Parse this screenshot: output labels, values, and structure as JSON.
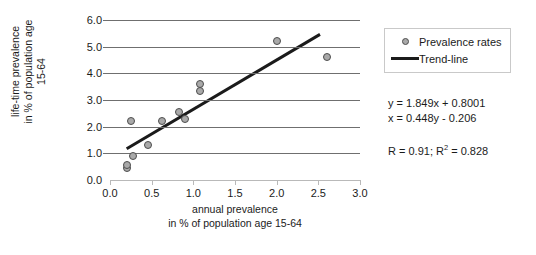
{
  "chart_data": {
    "type": "scatter",
    "title": "",
    "xlabel": "annual prevalence in % of population age 15-64",
    "ylabel": "life-time prevalence in % of population age 15-64",
    "xlim": [
      0.0,
      3.0
    ],
    "ylim": [
      0.0,
      6.0
    ],
    "grid": true,
    "legend_position": "right",
    "x_ticks": [
      "0.0",
      "0.5",
      "1.0",
      "1.5",
      "2.0",
      "2.5",
      "3.0"
    ],
    "x_tick_values": [
      0.0,
      0.5,
      1.0,
      1.5,
      2.0,
      2.5,
      3.0
    ],
    "y_ticks": [
      "0.0",
      "1.0",
      "2.0",
      "3.0",
      "4.0",
      "5.0",
      "6.0"
    ],
    "y_tick_values": [
      0.0,
      1.0,
      2.0,
      3.0,
      4.0,
      5.0,
      6.0
    ],
    "series": [
      {
        "name": "Prevalence rates",
        "type": "scatter",
        "marker": "circle",
        "points": [
          {
            "x": 0.2,
            "y": 0.45
          },
          {
            "x": 0.2,
            "y": 0.55
          },
          {
            "x": 0.27,
            "y": 0.9
          },
          {
            "x": 0.25,
            "y": 2.2
          },
          {
            "x": 0.45,
            "y": 1.3
          },
          {
            "x": 0.62,
            "y": 2.2
          },
          {
            "x": 0.83,
            "y": 2.55
          },
          {
            "x": 0.9,
            "y": 2.3
          },
          {
            "x": 1.08,
            "y": 3.6
          },
          {
            "x": 1.08,
            "y": 3.35
          },
          {
            "x": 2.0,
            "y": 5.2
          },
          {
            "x": 2.6,
            "y": 4.6
          }
        ]
      },
      {
        "name": "Trend-line",
        "type": "line",
        "equation": "y = 1.849x + 0.8001",
        "slope": 1.849,
        "intercept": 0.8001,
        "x_start": 0.2,
        "x_end": 2.52
      }
    ]
  },
  "legend": {
    "items": [
      {
        "label": "Prevalence rates",
        "marker": "circle-marker"
      },
      {
        "label": "Trend-line",
        "marker": "line-marker"
      }
    ]
  },
  "stats": {
    "equation_y": "y = 1.849x + 0.8001",
    "equation_x": "x = 0.448y - 0.206",
    "r_prefix": "R = 0.91; R",
    "r_squared_exp": "2",
    "r_squared_value": " = 0.828"
  },
  "axes": {
    "y_title_line1": "life-time prevalence",
    "y_title_line2": "in % of population age",
    "y_title_line3": "15-64",
    "x_title_line1": "annual prevalence",
    "x_title_line2": "in % of population age 15-64"
  },
  "colors": {
    "marker_fill": "#a9a9a9",
    "marker_edge": "#4d4d4d",
    "trendline": "#1b1b1b",
    "gridline": "#6f6f6f",
    "axis": "#b9b9b9"
  }
}
